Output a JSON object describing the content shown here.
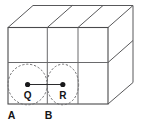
{
  "figure": {
    "colors": {
      "background": "#ffffff",
      "edge": "#58585a",
      "front_edge": "#4a4a4c",
      "grid": "#6a6a6c",
      "dashed_circle": "#6d6d6f",
      "radius_line": "#2b2b2d",
      "point_dot": "#18181a",
      "label_text": "#141416"
    },
    "solid": {
      "type": "rectangular-prism",
      "projection": "oblique",
      "front_face": {
        "columns": 3,
        "rows": 2,
        "left_x": 8,
        "right_x": 108,
        "top_y": 27,
        "bottom_y": 104,
        "column_divider_x": [
          47.3,
          78.0
        ],
        "row_divider_y": 62.5
      },
      "depth_offset": {
        "dx": 25,
        "dy": -22
      }
    },
    "circles": [
      {
        "name": "circle-Q",
        "center_label": "Q",
        "cx": 27.6,
        "cy": 84.5,
        "rx": 19.6,
        "ry": 20.3,
        "style": "dashed"
      },
      {
        "name": "circle-R",
        "center_label": "R",
        "cx": 62.8,
        "cy": 84.5,
        "rx": 15.8,
        "ry": 20.3,
        "style": "dashed"
      }
    ],
    "points": [
      {
        "id": "point-q",
        "label": "Q",
        "x": 27.6,
        "y": 84.5,
        "label_x": 27.6,
        "label_y": 98.5
      },
      {
        "id": "point-r",
        "label": "R",
        "x": 62.8,
        "y": 84.5,
        "label_x": 62.8,
        "label_y": 98.5
      }
    ],
    "segment": {
      "name": "segment-QR",
      "from": "Q",
      "to": "R",
      "x1": 27.6,
      "y1": 84.5,
      "x2": 62.8,
      "y2": 84.5
    },
    "corner_labels": [
      {
        "id": "label-a",
        "text": "A",
        "x": 11.5,
        "y": 118.5
      },
      {
        "id": "label-b",
        "text": "B",
        "x": 48.5,
        "y": 118.5
      }
    ]
  },
  "labels": {
    "q": "Q",
    "r": "R",
    "a": "A",
    "b": "B"
  }
}
